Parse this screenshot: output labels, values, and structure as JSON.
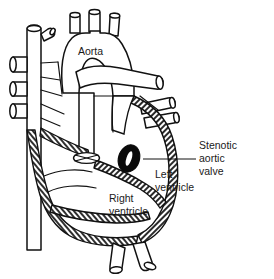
{
  "figure": {
    "title": "Stenotic aortic valve",
    "width": 274,
    "height": 279,
    "background_color": "#ffffff",
    "line_color": "#111111",
    "hatch_color": "#2a2a2a"
  },
  "labels": {
    "aorta": "Aorta",
    "left_ventricle_line1": "Left",
    "left_ventricle_line2": "ventricle",
    "right_ventricle_line1": "Right",
    "right_ventricle_line2": "ventricle",
    "stenotic_line1": "Stenotic",
    "stenotic_line2": "aortic",
    "stenotic_line3": "valve"
  },
  "structures": [
    {
      "name": "aortic-arch",
      "kind": "vessel"
    },
    {
      "name": "brachiocephalic-trunk",
      "kind": "vessel-stump"
    },
    {
      "name": "left-common-carotid-artery",
      "kind": "vessel-stump"
    },
    {
      "name": "left-subclavian-artery",
      "kind": "vessel-stump"
    },
    {
      "name": "superior-vena-cava",
      "kind": "vessel"
    },
    {
      "name": "pulmonary-artery",
      "kind": "vessel"
    },
    {
      "name": "pulmonary-veins-left",
      "kind": "vessel-stump"
    },
    {
      "name": "pulmonary-veins-right",
      "kind": "vessel-stump"
    },
    {
      "name": "descending-aorta",
      "kind": "vessel"
    },
    {
      "name": "right-ventricle",
      "kind": "chamber"
    },
    {
      "name": "left-ventricle",
      "kind": "chamber"
    },
    {
      "name": "stenotic-aortic-valve",
      "kind": "valve",
      "state": "stenotic"
    },
    {
      "name": "pulmonary-valve",
      "kind": "valve",
      "state": "normal"
    }
  ]
}
